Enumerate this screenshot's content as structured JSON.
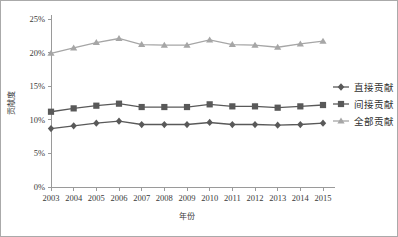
{
  "chart_data": {
    "type": "line",
    "title": "",
    "xlabel": "年份",
    "ylabel": "贡献度",
    "categories": [
      "2003",
      "2004",
      "2005",
      "2006",
      "2007",
      "2008",
      "2009",
      "2010",
      "2011",
      "2012",
      "2013",
      "2014",
      "2015"
    ],
    "x_tick_labels": [
      "2003",
      "2004",
      "2005",
      "2006",
      "2007",
      "2008",
      "2009",
      "2010",
      "2011",
      "2012",
      "2013",
      "2014",
      "2015"
    ],
    "y_tick_labels": [
      "0%",
      "5%",
      "10%",
      "15%",
      "20%",
      "25%"
    ],
    "y_tick_values": [
      0,
      5,
      10,
      15,
      20,
      25
    ],
    "ylim": [
      0,
      25
    ],
    "grid": false,
    "legend_position": "right",
    "series": [
      {
        "name": "直接贡献",
        "marker": "diamond",
        "color": "#595959",
        "values": [
          8.7,
          9.1,
          9.5,
          9.8,
          9.3,
          9.3,
          9.3,
          9.6,
          9.3,
          9.3,
          9.2,
          9.3,
          9.5
        ]
      },
      {
        "name": "间接贡献",
        "marker": "square",
        "color": "#595959",
        "values": [
          11.2,
          11.7,
          12.1,
          12.4,
          11.9,
          11.9,
          11.9,
          12.3,
          12.0,
          12.0,
          11.8,
          12.0,
          12.2
        ]
      },
      {
        "name": "全部贡献",
        "marker": "triangle",
        "color": "#a6a6a6",
        "values": [
          19.9,
          20.7,
          21.5,
          22.1,
          21.2,
          21.1,
          21.1,
          21.9,
          21.2,
          21.1,
          20.8,
          21.3,
          21.7
        ]
      }
    ]
  },
  "legend": {
    "items": [
      {
        "label": "直接贡献",
        "marker": "diamond-marker-icon"
      },
      {
        "label": "间接贡献",
        "marker": "square-marker-icon"
      },
      {
        "label": "全部贡献",
        "marker": "triangle-marker-icon"
      }
    ]
  },
  "axes": {
    "x_title": "年份",
    "y_title": "贡献度"
  },
  "colors": {
    "series_dark": "#595959",
    "series_light": "#a6a6a6",
    "axis": "#9a9a9a",
    "border": "#aaaaaa",
    "text": "#3a3a3a"
  }
}
